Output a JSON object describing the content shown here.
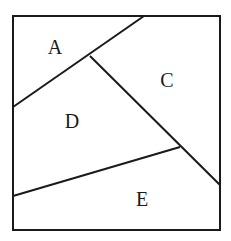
{
  "diagram": {
    "type": "partitioned-square",
    "stroke_color": "#1a1a1a",
    "background_color": "#ffffff",
    "stroke_width": 2,
    "square": {
      "x": 13,
      "y": 16,
      "width": 207,
      "height": 214
    },
    "dividers": [
      {
        "name": "line-a-boundary",
        "x1": 13,
        "y1": 107,
        "x2": 144,
        "y2": 16
      },
      {
        "name": "line-c-d-boundary",
        "x1": 90,
        "y1": 56,
        "x2": 220,
        "y2": 185
      },
      {
        "name": "line-d-e-boundary",
        "x1": 13,
        "y1": 196,
        "x2": 180,
        "y2": 147
      }
    ],
    "regions": [
      {
        "label": "A",
        "x": 55,
        "y": 54
      },
      {
        "label": "C",
        "x": 167,
        "y": 87
      },
      {
        "label": "D",
        "x": 72,
        "y": 128
      },
      {
        "label": "E",
        "x": 142,
        "y": 206
      }
    ]
  }
}
